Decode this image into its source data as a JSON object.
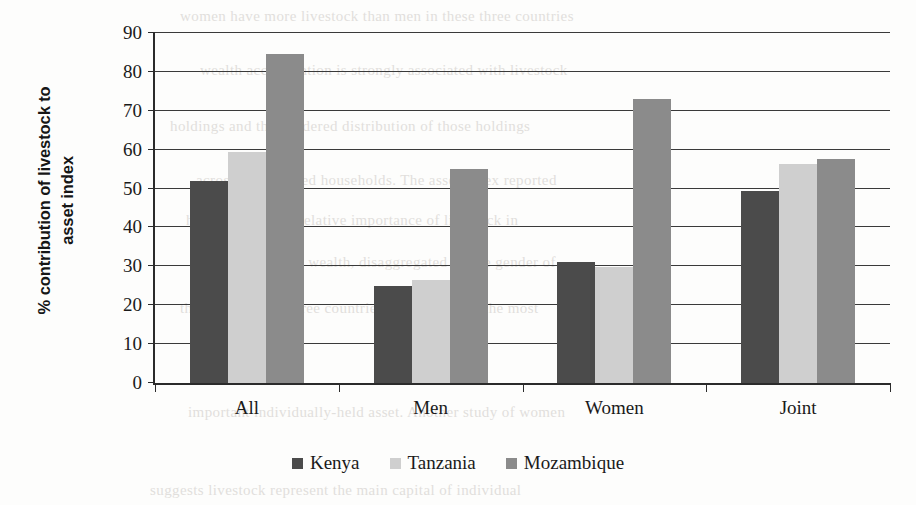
{
  "chart_data": {
    "type": "bar",
    "title": "",
    "xlabel": "",
    "ylabel": "% contribution of livestock to asset index",
    "ylabel_line1": "% contribution of livestock to",
    "ylabel_line2": "asset index",
    "categories": [
      "All",
      "Men",
      "Women",
      "Joint"
    ],
    "series": [
      {
        "name": "Kenya",
        "color": "#4b4b4b",
        "values": [
          52.0,
          25.0,
          31.0,
          49.5
        ]
      },
      {
        "name": "Tanzania",
        "color": "#cfcfcf",
        "values": [
          59.3,
          26.5,
          29.8,
          56.2
        ]
      },
      {
        "name": "Mozambique",
        "color": "#8b8b8b",
        "values": [
          84.6,
          55.0,
          73.0,
          57.6
        ]
      }
    ],
    "ylim": [
      0,
      90
    ],
    "yticks": [
      0,
      10,
      20,
      30,
      40,
      50,
      60,
      70,
      80,
      90
    ],
    "ytick_labels": [
      "0",
      "10",
      "20",
      "30",
      "40",
      "50",
      "60",
      "70",
      "80",
      "90"
    ],
    "grid": true,
    "grid_axis": "y",
    "legend_position": "bottom"
  },
  "legend": {
    "items": [
      {
        "label": "Kenya"
      },
      {
        "label": "Tanzania"
      },
      {
        "label": "Mozambique"
      }
    ]
  },
  "background_text": {
    "lines": [
      "women have more livestock than men in these three countries",
      "wealth accumulation is strongly associated with livestock",
      "holdings and the gendered distribution of those holdings",
      "across the sampled households. The asset index reported",
      "here captures the relative importance of livestock in",
      "total household wealth, disaggregated by the gender of",
      "the owner. In all three countries livestock were the most",
      "important individually-held asset. Another study of women",
      "suggests livestock represent the main capital of individual"
    ]
  }
}
